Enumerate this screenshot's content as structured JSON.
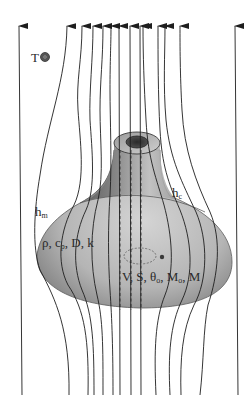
{
  "figure": {
    "labels": {
      "ambient_temperature": {
        "symbol": "T",
        "subscript_icon": "infinity-circle"
      },
      "mass_transfer_coeff": {
        "symbol": "h",
        "subscript": "m"
      },
      "heat_transfer_coeff": {
        "symbol": "h",
        "subscript": "c"
      },
      "material_properties": "ρ, c",
      "material_properties_sub": "p",
      "material_properties_rest": ", D, k",
      "state_variables": "V, S, θ",
      "state_variables_sub1": "o",
      "state_variables_mid": ", M",
      "state_variables_sub2": "o",
      "state_variables_end": ", M"
    },
    "flow": {
      "direction": "up",
      "streamline_count": 14,
      "arrowhead_x": [
        19,
        67,
        82,
        93,
        103,
        111,
        119,
        130,
        140,
        143,
        158,
        165,
        180,
        235
      ],
      "bottom_x": [
        22,
        69,
        88,
        94,
        103,
        113,
        120,
        131,
        141,
        156,
        170,
        181,
        200,
        238
      ]
    },
    "colors": {
      "streamline": "#1e1e1e",
      "body_light": "#cfcfcf",
      "body_dark": "#6e6e6e",
      "bore": "#3a3a3a",
      "text": "#2a2a2a"
    }
  }
}
